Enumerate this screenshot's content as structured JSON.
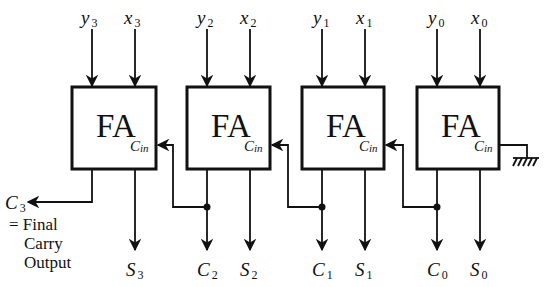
{
  "diagram": {
    "type": "4-bit ripple carry adder",
    "block_label": "FA",
    "carry_in_label": {
      "base": "C",
      "sub": "in"
    },
    "adders": [
      {
        "label": "FA",
        "inputs": [
          {
            "base": "y",
            "sub": "3"
          },
          {
            "base": "x",
            "sub": "3"
          }
        ],
        "sum": {
          "base": "S",
          "sub": "3"
        },
        "carry_out": {
          "base": "C",
          "sub": "3"
        }
      },
      {
        "label": "FA",
        "inputs": [
          {
            "base": "y",
            "sub": "2"
          },
          {
            "base": "x",
            "sub": "2"
          }
        ],
        "sum": {
          "base": "S",
          "sub": "2"
        },
        "carry_out": {
          "base": "C",
          "sub": "2"
        }
      },
      {
        "label": "FA",
        "inputs": [
          {
            "base": "y",
            "sub": "1"
          },
          {
            "base": "x",
            "sub": "1"
          }
        ],
        "sum": {
          "base": "S",
          "sub": "1"
        },
        "carry_out": {
          "base": "C",
          "sub": "1"
        }
      },
      {
        "label": "FA",
        "inputs": [
          {
            "base": "y",
            "sub": "0"
          },
          {
            "base": "x",
            "sub": "0"
          }
        ],
        "sum": {
          "base": "S",
          "sub": "0"
        },
        "carry_out": {
          "base": "C",
          "sub": "0"
        }
      }
    ],
    "final_carry_note": {
      "line1": "= Final",
      "line2": "Carry",
      "line3": "Output"
    },
    "ground_symbol": "ground-icon"
  }
}
